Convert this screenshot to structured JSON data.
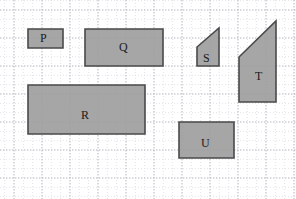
{
  "figure": {
    "type": "geometry-shapes-on-grid",
    "width": 296,
    "height": 199,
    "background_color": "#ffffff",
    "grid": {
      "major_color": "#b9b9c4",
      "minor_color": "#d8d8e0",
      "major_spacing_px": 28,
      "minor_spacing_px": 9.333,
      "origin_x_px": 14,
      "origin_y_px": 10,
      "style": "dotted"
    },
    "shape_style": {
      "fill_color": "#9e9e9e",
      "stroke_color": "#4a4a4a",
      "stroke_width_px": 1.6,
      "label_color": "#1a1a1a"
    },
    "shapes": [
      {
        "id": "P",
        "label": "P",
        "kind": "rectangle",
        "points": "28,29 63,29 63,48 28,48",
        "x": 28,
        "y": 29,
        "width": 35,
        "height": 19,
        "label_x": 45,
        "label_y": 38
      },
      {
        "id": "Q",
        "label": "Q",
        "kind": "rectangle",
        "points": "85,29 163,29 163,66 85,66",
        "x": 85,
        "y": 29,
        "width": 78,
        "height": 37,
        "label_x": 124,
        "label_y": 47
      },
      {
        "id": "R",
        "label": "R",
        "kind": "rectangle",
        "points": "28,85 145,85 145,134 28,134",
        "x": 28,
        "y": 85,
        "width": 117,
        "height": 49,
        "label_x": 86,
        "label_y": 115
      },
      {
        "id": "S",
        "label": "S",
        "kind": "trapezoid",
        "points": "197,47 219,28 219,66 197,66",
        "label_x": 208,
        "label_y": 58
      },
      {
        "id": "T",
        "label": "T",
        "kind": "trapezoid",
        "points": "239,57 276,21 276,102 239,102",
        "label_x": 260,
        "label_y": 76
      },
      {
        "id": "U",
        "label": "U",
        "kind": "rectangle",
        "points": "179,122 234,122 234,158 179,158",
        "x": 179,
        "y": 122,
        "width": 55,
        "height": 36,
        "label_x": 206,
        "label_y": 143
      }
    ]
  }
}
